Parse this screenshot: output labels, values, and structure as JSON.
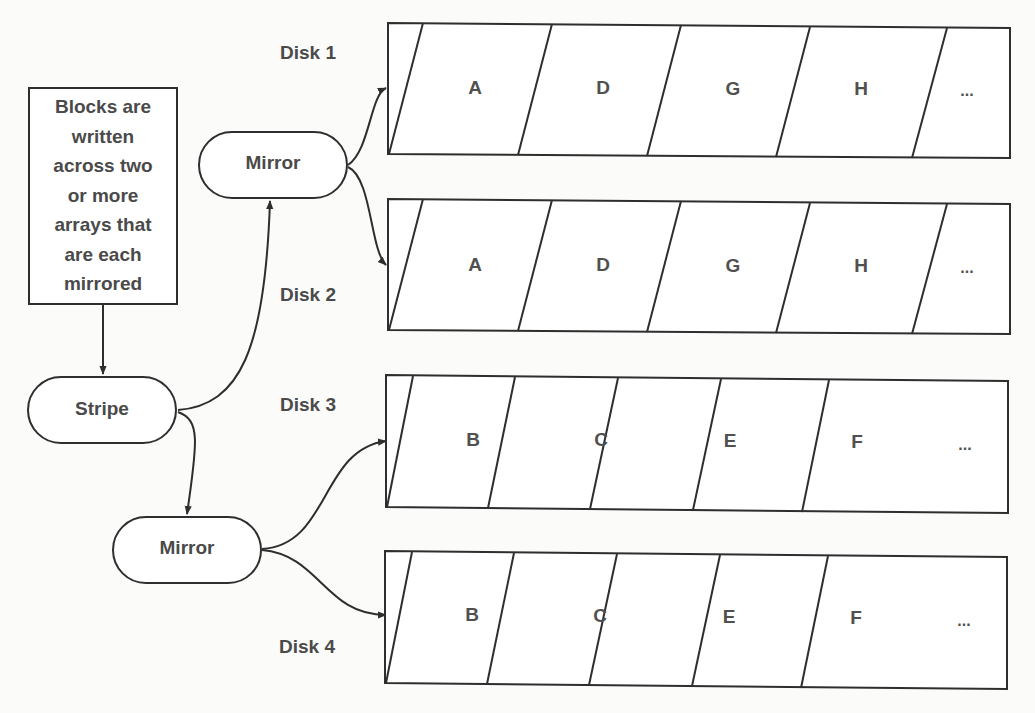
{
  "note": {
    "lines": [
      "Blocks are",
      "written",
      "across two",
      "or more",
      "arrays that",
      "are each",
      "mirrored"
    ]
  },
  "nodes": {
    "stripe": "Stripe",
    "mirror_top": "Mirror",
    "mirror_bottom": "Mirror"
  },
  "disks": [
    {
      "label": "Disk 1",
      "blocks": [
        "A",
        "D",
        "G",
        "H",
        "..."
      ]
    },
    {
      "label": "Disk 2",
      "blocks": [
        "A",
        "D",
        "G",
        "H",
        "..."
      ]
    },
    {
      "label": "Disk 3",
      "blocks": [
        "B",
        "C",
        "E",
        "F",
        "..."
      ]
    },
    {
      "label": "Disk 4",
      "blocks": [
        "B",
        "C",
        "E",
        "F",
        "..."
      ]
    }
  ],
  "colors": {
    "stroke": "#2e2e2e",
    "text": "#4a4a4a",
    "background": "#fbfbfa"
  }
}
